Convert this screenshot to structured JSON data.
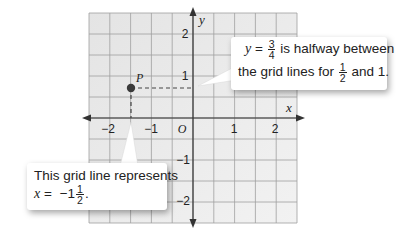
{
  "chart_data": {
    "type": "scatter",
    "title": "",
    "xlabel": "x",
    "ylabel": "y",
    "xlim": [
      -2.5,
      2.5
    ],
    "ylim": [
      -2.5,
      2.5
    ],
    "grid": true,
    "grid_step": 0.5,
    "x_ticks": [
      "-2",
      "-1",
      "O",
      "1",
      "2"
    ],
    "y_ticks": [
      "2",
      "1",
      "-1",
      "-2"
    ],
    "points": [
      {
        "label": "P",
        "x": -1.5,
        "y": 0.75
      }
    ],
    "guides": [
      {
        "type": "dashed",
        "from": [
          -1.5,
          0.75
        ],
        "to": [
          0,
          0.75
        ]
      },
      {
        "type": "dashed",
        "from": [
          -1.5,
          0.75
        ],
        "to": [
          -1.5,
          0
        ]
      }
    ]
  },
  "axes": {
    "x_label": "x",
    "y_label": "y",
    "origin_label": "O",
    "x_tick_labels": [
      "−2",
      "−1",
      "1",
      "2"
    ],
    "y_tick_labels": [
      "2",
      "1",
      "−1",
      "−2"
    ]
  },
  "point": {
    "label": "P"
  },
  "callouts": {
    "right": {
      "var": "y",
      "eq": "=",
      "frac_num": "3",
      "frac_den": "4",
      "line1_rest": "is halfway between",
      "line2_pre": "the grid lines for",
      "frac2_num": "1",
      "frac2_den": "2",
      "line2_post": "and 1."
    },
    "left": {
      "line1": "This grid line represents",
      "var": "x",
      "eq": "=",
      "whole": "−1",
      "frac_num": "1",
      "frac_den": "2",
      "post": "."
    }
  },
  "colors": {
    "grid_bg": "#ececec",
    "grid_line": "#9a9a9a",
    "axis": "#333333",
    "point": "#3a3a3a"
  }
}
